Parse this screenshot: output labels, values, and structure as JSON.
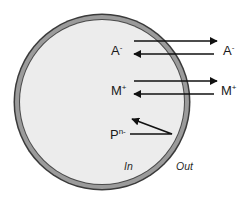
{
  "diagram": {
    "cell": {
      "center_x": 102,
      "center_y": 102,
      "radius": 85,
      "fill_color": "#ececec",
      "membrane_color": "#9b9b9b",
      "membrane_edge_color": "#3a3a3a"
    },
    "ions": [
      {
        "id": "anion",
        "inside_label": {
          "base": "A",
          "superscript": "-"
        },
        "outside_label": {
          "base": "A",
          "superscript": "-"
        },
        "arrows": [
          {
            "direction": "out",
            "y": 41,
            "x1": 134,
            "x2": 217
          },
          {
            "direction": "in",
            "y": 54,
            "x1": 214,
            "x2": 133
          }
        ]
      },
      {
        "id": "cation",
        "inside_label": {
          "base": "M",
          "superscript": "+"
        },
        "outside_label": {
          "base": "M",
          "superscript": "+"
        },
        "arrows": [
          {
            "direction": "out",
            "y": 81,
            "x1": 134,
            "x2": 217
          },
          {
            "direction": "in",
            "y": 94,
            "x1": 214,
            "x2": 133
          }
        ]
      },
      {
        "id": "impermeant",
        "inside_label": {
          "base": "P",
          "superscript": "n-"
        },
        "reflect_arrow": {
          "from_x": 130,
          "from_y": 134,
          "vertex_x": 172,
          "vertex_y": 134,
          "to_x": 131,
          "to_y": 119
        }
      }
    ],
    "side_labels": {
      "inside": "In",
      "outside": "Out"
    },
    "arrow_color": "#111111"
  }
}
